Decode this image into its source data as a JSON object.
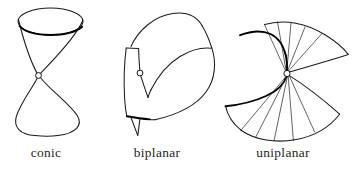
{
  "figure": {
    "background_color": "#ffffff",
    "stroke_color": "#1a1a1a",
    "accent_stroke_color": "#000000",
    "node_fill_color": "#ffffff",
    "width": 361,
    "height": 173,
    "panel_count": 3
  },
  "panels": [
    {
      "id": "conic",
      "caption": "conic",
      "caption_x": 46,
      "caption_y": 157,
      "node_label": "singular-node",
      "node_x": 38.5,
      "node_y": 75.5,
      "description": "double cone: upper elliptical disk tapering to a node, lower teardrop cone"
    },
    {
      "id": "biplanar",
      "caption": "biplanar",
      "caption_x": 157,
      "caption_y": 157,
      "node_label": "singular-node",
      "node_x": 140.0,
      "node_y": 73.0,
      "description": "folded surface with V-shaped crease, node on crease line, downward spike"
    },
    {
      "id": "uniplanar",
      "caption": "uniplanar",
      "caption_x": 283,
      "caption_y": 157,
      "node_label": "singular-node",
      "node_x": 287.0,
      "node_y": 73.5,
      "description": "ruled fan surface with radial generators converging at a node and a hooked edge curve"
    }
  ],
  "captions": {
    "conic": "conic",
    "biplanar": "biplanar",
    "uniplanar": "uniplanar"
  }
}
